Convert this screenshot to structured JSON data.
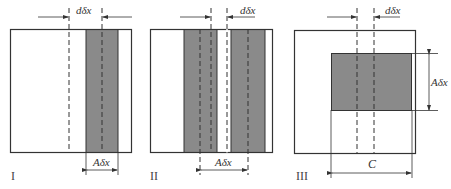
{
  "figure": {
    "colors": {
      "shade": "#8a8a8a",
      "stroke": "#333333",
      "background": "#ffffff"
    },
    "panels": [
      {
        "id": "I",
        "label": "I",
        "top_dim": "dδx",
        "bottom_dim": "Aδx"
      },
      {
        "id": "II",
        "label": "II",
        "top_dim": "dδx",
        "bottom_dim": "Aδx"
      },
      {
        "id": "III",
        "label": "III",
        "top_dim": "dδx",
        "side_dim": "Aδx",
        "bottom_dim": "C"
      }
    ]
  }
}
